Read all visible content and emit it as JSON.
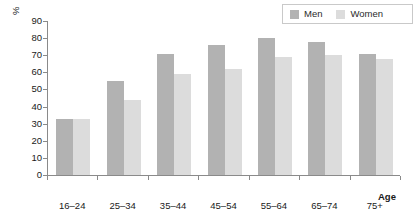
{
  "chart_data": {
    "type": "bar",
    "title": "",
    "subtitle": "",
    "xlabel": "Age",
    "ylabel": "%",
    "categories": [
      "16–24",
      "25–34",
      "35–44",
      "45–54",
      "55–64",
      "65–74",
      "75+"
    ],
    "series": [
      {
        "name": "Men",
        "color": "#b2b2b2",
        "values": [
          33,
          55,
          71,
          76,
          80,
          78,
          71
        ]
      },
      {
        "name": "Women",
        "color": "#dcdcdc",
        "values": [
          33,
          44,
          59,
          62,
          69,
          70,
          68
        ]
      }
    ],
    "ylim": [
      0,
      90
    ],
    "yticks": [
      "0",
      "10",
      "20",
      "30",
      "40",
      "50",
      "60",
      "70",
      "80",
      "90"
    ],
    "ytick_values": [
      0,
      10,
      20,
      30,
      40,
      50,
      60,
      70,
      80,
      90
    ],
    "grid": false,
    "legend_position": "top-right",
    "legend_entries": [
      "Men",
      "Women"
    ]
  },
  "legend": {
    "items": [
      {
        "label": "Men",
        "swatch": "legend-swatch-men"
      },
      {
        "label": "Women",
        "swatch": "legend-swatch-women"
      }
    ]
  }
}
